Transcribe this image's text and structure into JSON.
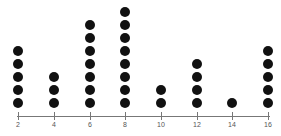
{
  "chart_data": {
    "type": "dot",
    "title": "",
    "xlabel": "",
    "ylabel": "",
    "categories": [
      2,
      4,
      6,
      8,
      10,
      12,
      14,
      16
    ],
    "values": [
      5,
      3,
      7,
      8,
      2,
      4,
      1,
      5
    ],
    "tick_labels": [
      "2",
      "4",
      "6",
      "8",
      "10",
      "12",
      "14",
      "16"
    ],
    "xlim": [
      2,
      16
    ],
    "grid": false,
    "legend": null
  },
  "layout": {
    "x_pixels": [
      18,
      54,
      90,
      125,
      161,
      197,
      232,
      268
    ],
    "base_y": 103,
    "spacing": 13,
    "dot_color": "#111111",
    "axis_color": "#777777"
  }
}
